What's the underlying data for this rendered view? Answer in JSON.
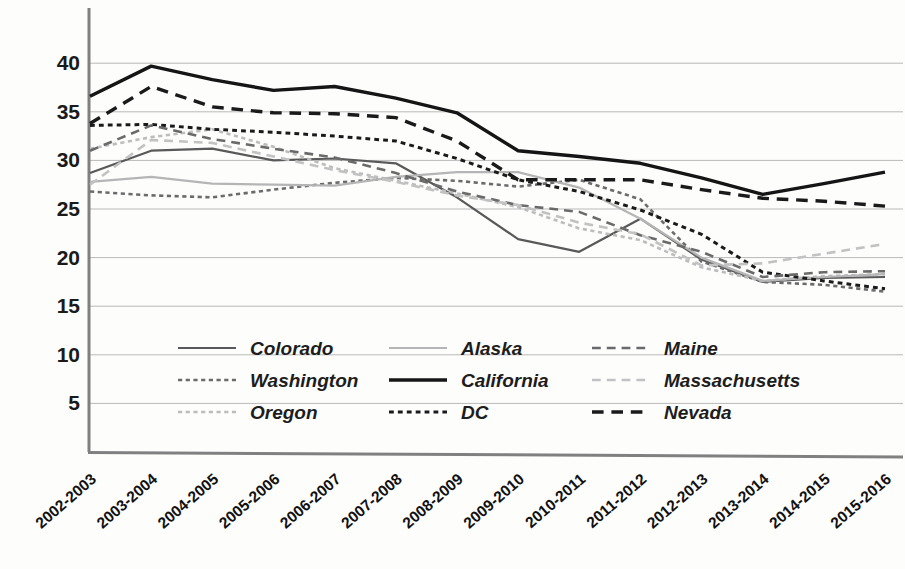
{
  "chart_data": {
    "type": "line",
    "title": "",
    "xlabel": "",
    "ylabel": "",
    "ylim": [
      0,
      42
    ],
    "yticks": [
      5,
      10,
      15,
      20,
      25,
      30,
      35,
      40
    ],
    "grid": true,
    "legend_position": "inside-bottom-left",
    "categories": [
      "2002-2003",
      "2003-2004",
      "2004-2005",
      "2005-2006",
      "2006-2007",
      "2007-2008",
      "2008-2009",
      "2009-2010",
      "2010-2011",
      "2011-2012",
      "2012-2013",
      "2013-2014",
      "2014-2015",
      "2015-2016"
    ],
    "series": [
      {
        "name": "Colorado",
        "style": "solid",
        "color": "#595959",
        "width": 2.2,
        "values": [
          28.7,
          31.0,
          31.2,
          30.0,
          30.2,
          29.7,
          26.2,
          21.9,
          20.6,
          24.0,
          19.8,
          17.5,
          17.9,
          18.0
        ]
      },
      {
        "name": "Washington",
        "style": "dotted",
        "color": "#6b6b6b",
        "width": 2.6,
        "values": [
          26.8,
          26.4,
          26.2,
          27.0,
          27.7,
          28.2,
          27.9,
          27.3,
          28.0,
          26.0,
          19.6,
          17.5,
          17.2,
          16.5
        ]
      },
      {
        "name": "Oregon",
        "style": "dotted",
        "color": "#bdbdbd",
        "width": 2.6,
        "values": [
          31.2,
          32.4,
          33.2,
          31.4,
          29.2,
          27.9,
          26.6,
          25.2,
          23.0,
          21.8,
          19.0,
          17.6,
          18.1,
          18.3
        ]
      },
      {
        "name": "Alaska",
        "style": "solid",
        "color": "#b5b5b5",
        "width": 2.2,
        "values": [
          27.8,
          28.3,
          27.6,
          27.5,
          27.4,
          28.3,
          28.8,
          28.8,
          27.2,
          24.0,
          20.0,
          17.6,
          18.0,
          18.3
        ]
      },
      {
        "name": "California",
        "style": "solid",
        "color": "#151515",
        "width": 3.4,
        "values": [
          36.6,
          39.7,
          38.3,
          37.2,
          37.6,
          36.4,
          34.9,
          31.0,
          30.4,
          29.7,
          28.2,
          26.5,
          27.6,
          28.8
        ]
      },
      {
        "name": "DC",
        "style": "dotted",
        "color": "#1a1a1a",
        "width": 3.0,
        "values": [
          33.6,
          33.7,
          33.2,
          32.9,
          32.5,
          32.0,
          30.2,
          28.0,
          26.8,
          24.9,
          22.4,
          18.5,
          17.6,
          16.8
        ]
      },
      {
        "name": "Maine",
        "style": "dashed",
        "color": "#6a6a6a",
        "width": 2.6,
        "values": [
          31.0,
          33.6,
          32.2,
          31.2,
          30.3,
          28.7,
          26.8,
          25.4,
          24.7,
          22.3,
          20.6,
          18.0,
          18.5,
          18.6
        ]
      },
      {
        "name": "Massachusetts",
        "style": "dashed",
        "color": "#c2c2c2",
        "width": 2.6,
        "values": [
          27.5,
          32.1,
          31.8,
          30.4,
          29.0,
          27.8,
          26.4,
          25.4,
          23.6,
          22.4,
          19.2,
          19.4,
          20.4,
          21.4
        ]
      },
      {
        "name": "Nevada",
        "style": "dashed",
        "color": "#1a1a1a",
        "width": 3.4,
        "values": [
          33.8,
          37.6,
          35.5,
          34.9,
          34.8,
          34.4,
          32.0,
          28.0,
          28.0,
          28.0,
          27.0,
          26.1,
          25.8,
          25.3
        ]
      }
    ],
    "legend_columns": [
      [
        "Colorado",
        "Washington",
        "Oregon"
      ],
      [
        "Alaska",
        "California",
        "DC"
      ],
      [
        "Maine",
        "Massachusetts",
        "Nevada"
      ]
    ]
  }
}
